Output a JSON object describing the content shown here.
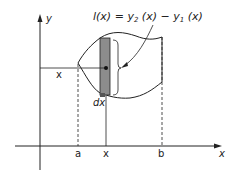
{
  "diagram": {
    "formula": {
      "lhs": "l(x)",
      "eq": " = ",
      "y2": "y",
      "y2_sub": "2",
      "y2_arg": " (x)",
      "minus": " − ",
      "y1": "y",
      "y1_sub": "1",
      "y1_arg": " (x)"
    },
    "axes": {
      "x_label": "x",
      "y_label": "y"
    },
    "ticks": {
      "a": "a",
      "x": "x",
      "b": "b"
    },
    "labels": {
      "dx": "dx",
      "x_distance": "x"
    },
    "colors": {
      "strip_fill": "#8c8c8c",
      "line": "#222222",
      "background": "#ffffff"
    }
  }
}
